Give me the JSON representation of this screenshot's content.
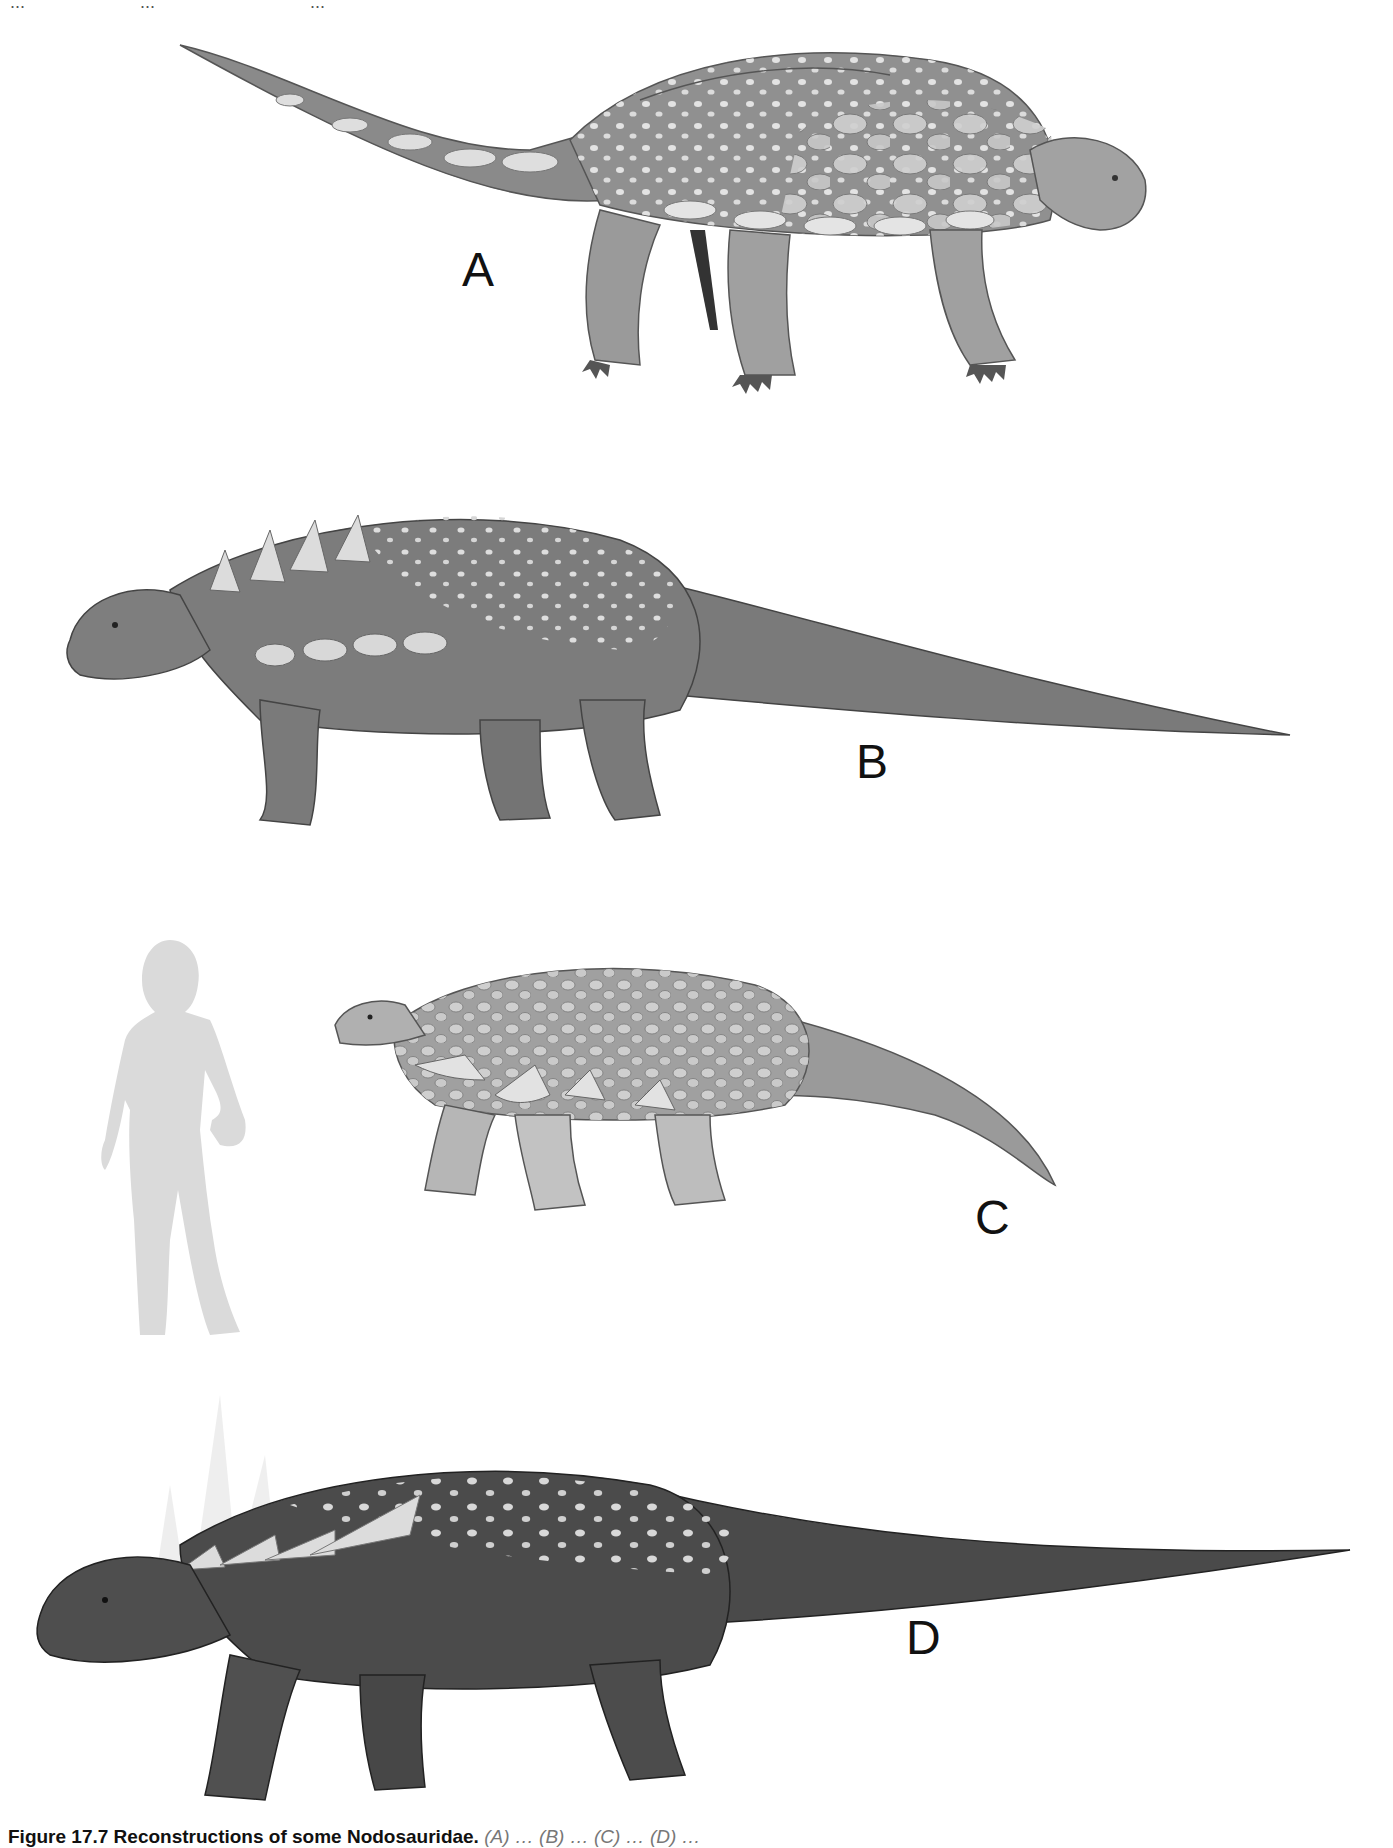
{
  "page": {
    "header_fragments": [
      "...",
      "...",
      "..."
    ],
    "background": "#ffffff"
  },
  "figure": {
    "panels": [
      {
        "label": "A",
        "tone": "#8d8d8d",
        "facing": "right",
        "description": "armored nodosaur, large oval scutes, tail to left"
      },
      {
        "label": "B",
        "tone": "#7a7a7a",
        "facing": "left",
        "description": "nodosaur with shoulder spikes, long tail to right"
      },
      {
        "label": "C",
        "tone": "#9a9a9a",
        "facing": "left",
        "description": "nodosaur with lateral spikes, shown with human scale silhouette"
      },
      {
        "label": "D",
        "tone": "#4a4a4a",
        "facing": "left",
        "description": "dark nodosaur with long shoulder spines, long tail to right"
      }
    ],
    "scale_silhouette": {
      "description": "human female silhouette for scale",
      "color": "#d9d9d9"
    }
  },
  "caption": {
    "number": "Figure 17.7",
    "title": "Reconstructions of some Nodosauridae.",
    "body": "(A) … (B) … (C) … (D) …",
    "truncated": true
  },
  "colors": {
    "label_text": "#111111",
    "caption_bold": "#111111",
    "caption_body": "#777777",
    "scute_highlight": "#e6e6e6"
  }
}
